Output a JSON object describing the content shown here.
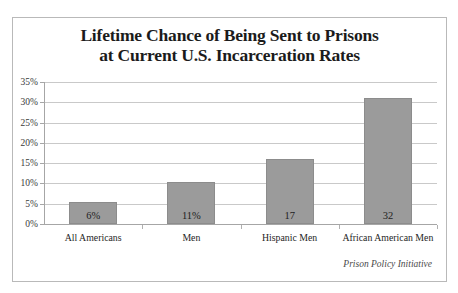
{
  "chart_data": {
    "type": "bar",
    "title": "Lifetime Chance of Being Sent to Prisons at Current U.S. Incarceration Rates",
    "title_line1": "Lifetime Chance of Being Sent to Prisons",
    "title_line2": "at Current U.S. Incarceration Rates",
    "subtitle": "",
    "xlabel": "",
    "ylabel": "",
    "ylim": [
      0,
      35
    ],
    "grid": true,
    "legend": false,
    "categories": [
      "All Americans",
      "Men",
      "Hispanic Men",
      "African American Men"
    ],
    "values": [
      5.5,
      10.3,
      16,
      31
    ],
    "data_labels": [
      "6%",
      "11%",
      "17",
      "32"
    ],
    "ytick_labels": [
      "0%",
      "5%",
      "10%",
      "15%",
      "20%",
      "25%",
      "30%",
      "35%"
    ],
    "ytick_values": [
      0,
      5,
      10,
      15,
      20,
      25,
      30,
      35
    ],
    "bar_color": "#9b9b9b",
    "bar_border_color": "#8c8c8c",
    "gridline_color": "#c9c9c9",
    "axis_color": "#a6a6a6",
    "text_color": "#1e1e1e",
    "attribution": "Prison Policy Initiative"
  }
}
